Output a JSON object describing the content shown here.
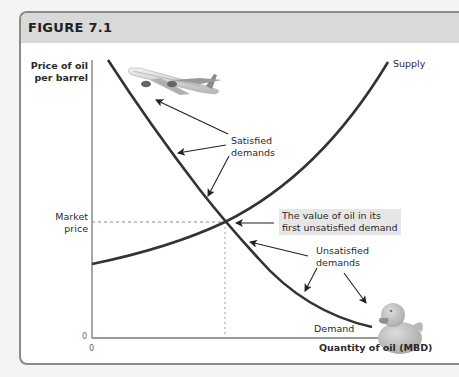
{
  "figure": {
    "title": "FIGURE 7.1"
  },
  "axes": {
    "y_label_line1": "Price of oil",
    "y_label_line2": "per barrel",
    "x_label": "Quantity of oil (MBD)",
    "y_origin": "0",
    "x_origin": "0",
    "market_price_line1": "Market",
    "market_price_line2": "price"
  },
  "curves": {
    "supply_label": "Supply",
    "demand_label": "Demand"
  },
  "annotations": {
    "satisfied_line1": "Satisfied",
    "satisfied_line2": "demands",
    "value_line1": "The value of oil in its",
    "value_line2": "first unsatisfied demand",
    "unsatisfied_line1": "Unsatisfied",
    "unsatisfied_line2": "demands"
  },
  "images": {
    "airplane": "airplane-photo",
    "rubber_duck": "rubber-duck-photo"
  },
  "colors": {
    "curve": "#333333",
    "header": "#d9d9d9",
    "callout_bg": "#e6e6e6",
    "border": "#8a8a8a"
  }
}
